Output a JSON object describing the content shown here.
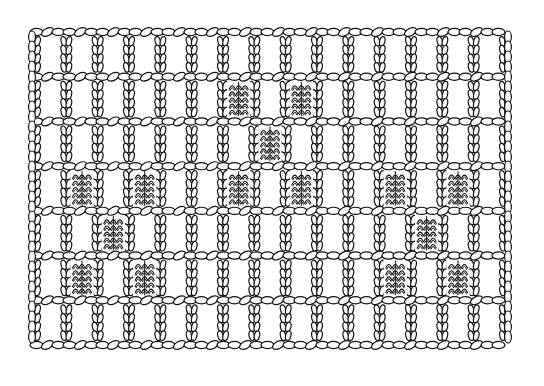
{
  "diagram": {
    "title": "",
    "colors": {
      "background": "#ffffff",
      "line": "#111111",
      "yarn_fill": "#ffffff"
    },
    "grid": {
      "left": 35,
      "right": 505,
      "top": 32,
      "bottom": 345,
      "cols": 15,
      "rows": 7
    },
    "filled_blocks": [
      {
        "row": 1,
        "col": 6
      },
      {
        "row": 1,
        "col": 8
      },
      {
        "row": 2,
        "col": 7
      },
      {
        "row": 3,
        "col": 1
      },
      {
        "row": 3,
        "col": 3
      },
      {
        "row": 3,
        "col": 6
      },
      {
        "row": 3,
        "col": 8
      },
      {
        "row": 3,
        "col": 11
      },
      {
        "row": 3,
        "col": 13
      },
      {
        "row": 4,
        "col": 2
      },
      {
        "row": 4,
        "col": 12
      },
      {
        "row": 5,
        "col": 1
      },
      {
        "row": 5,
        "col": 3
      },
      {
        "row": 5,
        "col": 11
      },
      {
        "row": 5,
        "col": 13
      }
    ]
  }
}
